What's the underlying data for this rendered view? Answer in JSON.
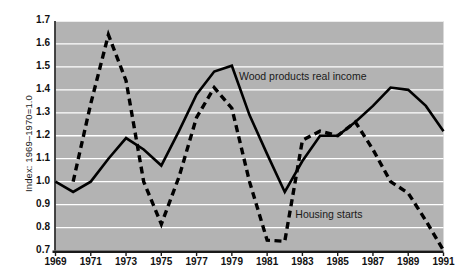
{
  "chart_data": {
    "type": "line",
    "title": "",
    "xlabel": "",
    "ylabel": "Index: 1969–1970=1.0",
    "xlim": [
      1969,
      1991
    ],
    "ylim": [
      0.7,
      1.7
    ],
    "grid": true,
    "grid_axis": "y",
    "legend_position": "inline-annotations",
    "plot_background": "#b3b3b3",
    "gridline_color": "#ffffff",
    "line_color": "#000000",
    "x": [
      1969,
      1970,
      1971,
      1972,
      1973,
      1974,
      1975,
      1976,
      1977,
      1978,
      1979,
      1980,
      1981,
      1982,
      1983,
      1984,
      1985,
      1986,
      1987,
      1988,
      1989,
      1990,
      1991
    ],
    "ytick_labels": [
      "1.7",
      "1.6",
      "1.5",
      "1.4",
      "1.3",
      "1.2",
      "1.1",
      "1.0",
      "0.9",
      "0.8",
      "0.7"
    ],
    "ytick_values": [
      1.7,
      1.6,
      1.5,
      1.4,
      1.3,
      1.2,
      1.1,
      1.0,
      0.9,
      0.8,
      0.7
    ],
    "xtick_labels": [
      "1969",
      "1971",
      "1973",
      "1975",
      "1977",
      "1979",
      "1981",
      "1983",
      "1985",
      "1987",
      "1989",
      "1991"
    ],
    "xtick_values": [
      1969,
      1971,
      1973,
      1975,
      1977,
      1979,
      1981,
      1983,
      1985,
      1987,
      1989,
      1991
    ],
    "series": [
      {
        "name": "Wood products real income",
        "style": "solid",
        "label_text": "Wood products real income",
        "x": [
          1969,
          1970,
          1971,
          1972,
          1973,
          1974,
          1975,
          1976,
          1977,
          1978,
          1979,
          1980,
          1981,
          1982,
          1983,
          1984,
          1985,
          1986,
          1987,
          1988,
          1989,
          1990,
          1991
        ],
        "values": [
          1.0,
          0.955,
          1.0,
          1.1,
          1.19,
          1.14,
          1.07,
          1.22,
          1.38,
          1.48,
          1.505,
          1.29,
          1.12,
          0.955,
          1.09,
          1.2,
          1.2,
          1.26,
          1.33,
          1.41,
          1.4,
          1.33,
          1.22
        ]
      },
      {
        "name": "Housing starts",
        "style": "dashed",
        "label_text": "Housing starts",
        "x": [
          1970,
          1971,
          1972,
          1973,
          1974,
          1975,
          1976,
          1977,
          1978,
          1979,
          1980,
          1981,
          1982,
          1983,
          1984,
          1985,
          1986,
          1987,
          1988,
          1989,
          1990,
          1991
        ],
        "values": [
          1.0,
          1.34,
          1.64,
          1.44,
          1.0,
          0.815,
          1.02,
          1.28,
          1.41,
          1.32,
          1.0,
          0.745,
          0.74,
          1.18,
          1.22,
          1.2,
          1.26,
          1.14,
          1.0,
          0.95,
          0.83,
          0.7
        ]
      }
    ],
    "annotations": [
      {
        "text": "Wood products real income",
        "x": 1979.4,
        "y": 1.455
      },
      {
        "text": "Housing starts",
        "x": 1982.6,
        "y": 0.855
      }
    ]
  }
}
